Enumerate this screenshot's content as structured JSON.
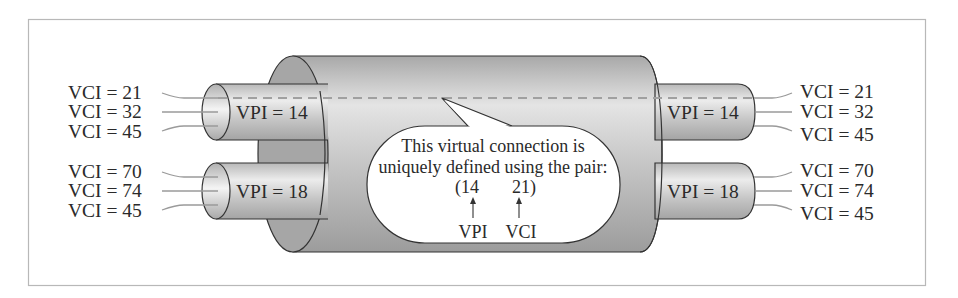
{
  "figure": {
    "colors": {
      "frame": "#b8b8b8",
      "cylinder_dark": "#9a9a9a",
      "cylinder_light": "#e6e6e6",
      "dashed_path": "#a8a8a8",
      "wire": "#9a9a9a",
      "text": "#2a2a2a"
    },
    "left_side": {
      "paths": [
        {
          "vpi_label": "VPI = 14",
          "vci_labels": [
            "VCI = 21",
            "VCI = 32",
            "VCI = 45"
          ]
        },
        {
          "vpi_label": "VPI = 18",
          "vci_labels": [
            "VCI = 70",
            "VCI = 74",
            "VCI = 45"
          ]
        }
      ]
    },
    "right_side": {
      "paths": [
        {
          "vpi_label": "VPI = 14",
          "vci_labels": [
            "VCI = 21",
            "VCI = 32",
            "VCI = 45"
          ]
        },
        {
          "vpi_label": "VPI = 18",
          "vci_labels": [
            "VCI = 70",
            "VCI = 74",
            "VCI = 45"
          ]
        }
      ]
    },
    "callout": {
      "line1": "This virtual connection is",
      "line2": "uniquely defined using the pair:",
      "pair_open": "(14",
      "pair_close": "21)",
      "vpi_caption": "VPI",
      "vci_caption": "VCI"
    }
  }
}
